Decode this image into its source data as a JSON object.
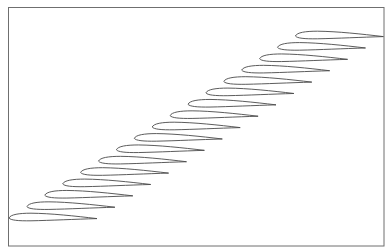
{
  "figure": {
    "airfoil_count": 17,
    "frame": {
      "x": 8.5,
      "y": 7.5,
      "width": 375.5,
      "height": 238.5,
      "color": "#6f6f6f"
    },
    "stroke_color": "#4a4a4a",
    "first_leading_edge": {
      "x": 9,
      "y": 218
    },
    "step": {
      "dx": 17.9,
      "dy": -11.375
    },
    "chord_px": 88
  }
}
